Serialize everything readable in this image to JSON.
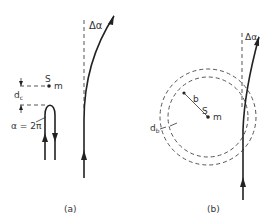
{
  "figure": {
    "panel_a": {
      "caption": "(a)",
      "mass_label": "S",
      "mass_symbol": "m",
      "distance_label": "d",
      "distance_subscript": "c",
      "loop_label": "α = 2π",
      "deflection_label": "Δα"
    },
    "panel_b": {
      "caption": "(b)",
      "mass_label": "S",
      "mass_symbol": "m",
      "radius_label": "b",
      "width_label": "d",
      "width_subscript": "b",
      "deflection_label": "Δα"
    }
  }
}
